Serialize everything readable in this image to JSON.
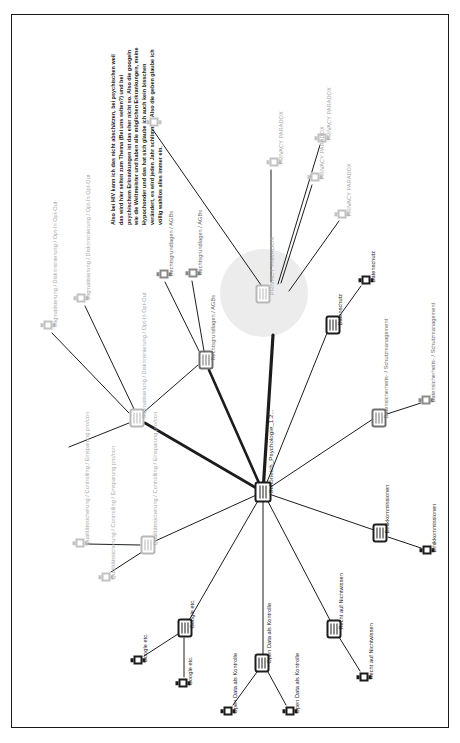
{
  "document": {
    "type": "code-map",
    "page_border_color": "#1a1a1a",
    "background": "#ffffff"
  },
  "quote": {
    "name": "memo-quote",
    "text": "Also bei HIV kann ich das nicht abschätzen, bei psychischen weil das wird hier selten zum Thema (Bei uns selten?) und bei psychischem Erkrankungen ist das eher nicht so. Also die googeln wie die Weltmeister und haben alle möglichen Erkrankungen, meine Hypochonder und das hat sich glaube ich auch kein bisschen verändert, es wird jeden Jahr schlimmer. Also die geben glaube ich völlig wahllos alles immer ein."
  },
  "central": {
    "name": "privacy-paradox-hub",
    "label": "PRIVACY PARADOX",
    "halo_color": "#ececec"
  },
  "hub": {
    "name": "document-hub",
    "label": "Schöneich_Psychologie_1.2..."
  },
  "nodes": [
    {
      "id": "pp-center",
      "label": "PRIVACY PARADOX",
      "glyph": "code",
      "tone": "light",
      "x": 261,
      "y": 279,
      "lx": 10,
      "ly": 6,
      "rot": true
    },
    {
      "id": "pp-1",
      "label": "PRIVACY PARADOX",
      "glyph": "memo",
      "tone": "light",
      "x": 310,
      "y": 123,
      "lx": 9,
      "ly": 6
    },
    {
      "id": "pp-2",
      "label": "PRIVACY PARADOX",
      "glyph": "memo",
      "tone": "light",
      "x": 262,
      "y": 147,
      "lx": 9,
      "ly": 6
    },
    {
      "id": "pp-3",
      "label": "PRIVACY PARADOX",
      "glyph": "memo",
      "tone": "light",
      "x": 303,
      "y": 162,
      "lx": 9,
      "ly": 6
    },
    {
      "id": "pp-4",
      "label": "PRIVACY PARADOX",
      "glyph": "memo",
      "tone": "light",
      "x": 330,
      "y": 199,
      "lx": 9,
      "ly": 6
    },
    {
      "id": "quote-memo",
      "label": "",
      "glyph": "memo",
      "tone": "light",
      "x": 142,
      "y": 107,
      "lx": 0,
      "ly": 0
    },
    {
      "id": "rg-node",
      "label": "Rechtsgrundlagen / AGBs",
      "glyph": "code",
      "tone": "mid",
      "x": 194,
      "y": 345,
      "lx": 10,
      "ly": 6,
      "rot": true
    },
    {
      "id": "rg-m1",
      "label": "Rechtsgrundlagen / AGBs",
      "glyph": "memo",
      "tone": "mid",
      "x": 181,
      "y": 258,
      "lx": 9,
      "ly": 6
    },
    {
      "id": "rg-m2",
      "label": "Rechtsgrundlagen / AGBs",
      "glyph": "memo",
      "tone": "mid",
      "x": 152,
      "y": 259,
      "lx": 9,
      "ly": 6
    },
    {
      "id": "st-node",
      "label": "Stigmatisierung / Diskriminierung / Opt-In Opt-Out",
      "glyph": "code",
      "tone": "light",
      "x": 125,
      "y": 403,
      "lx": 10,
      "ly": 6,
      "rot": true
    },
    {
      "id": "st-m1",
      "label": "Stigmatisierung / Diskriminierung / Opt-In Opt-Out",
      "glyph": "memo",
      "tone": "light",
      "x": 69,
      "y": 283,
      "lx": 9,
      "ly": 6
    },
    {
      "id": "st-m2",
      "label": "Stigmatisierung / Diskriminierung / Opt-In Opt-Out",
      "glyph": "memo",
      "tone": "light",
      "x": 36,
      "y": 310,
      "lx": 9,
      "ly": 6
    },
    {
      "id": "qs-node",
      "label": "Qualitätssicherung / Controlling / Einsparung pro/con",
      "glyph": "code",
      "tone": "light",
      "x": 136,
      "y": 530,
      "lx": 10,
      "ly": 6,
      "rot": true
    },
    {
      "id": "qs-m1",
      "label": "Qualitätssicherung / Controlling / Einsparung pro/con",
      "glyph": "memo",
      "tone": "light",
      "x": 68,
      "y": 528,
      "lx": 9,
      "ly": 6
    },
    {
      "id": "qs-m2",
      "label": "Qualitätssicherung / Controlling / Einsparung pro/con",
      "glyph": "memo",
      "tone": "light",
      "x": 94,
      "y": 562,
      "lx": 9,
      "ly": 6
    },
    {
      "id": "gg-node",
      "label": "Google etc.",
      "glyph": "code",
      "tone": "dark",
      "x": 173,
      "y": 613,
      "lx": 10,
      "ly": 6,
      "rot": true
    },
    {
      "id": "gg-m1",
      "label": "Google etc.",
      "glyph": "memo",
      "tone": "dark",
      "x": 126,
      "y": 645,
      "lx": 9,
      "ly": 6
    },
    {
      "id": "gg-m2",
      "label": "Google etc.",
      "glyph": "memo",
      "tone": "dark",
      "x": 171,
      "y": 668,
      "lx": 9,
      "ly": 6
    },
    {
      "id": "od-node",
      "label": "Open Data als Kontrolle",
      "glyph": "code",
      "tone": "dark",
      "x": 250,
      "y": 648,
      "lx": 10,
      "ly": 6,
      "rot": true
    },
    {
      "id": "od-m1",
      "label": "Open Data als Kontrolle",
      "glyph": "memo",
      "tone": "dark",
      "x": 216,
      "y": 696,
      "lx": 9,
      "ly": 6
    },
    {
      "id": "od-m2",
      "label": "Open Data als Kontrolle",
      "glyph": "memo",
      "tone": "dark",
      "x": 278,
      "y": 696,
      "lx": 9,
      "ly": 6
    },
    {
      "id": "rn-node",
      "label": "Recht auf Nichtwissen",
      "glyph": "code",
      "tone": "dark",
      "x": 322,
      "y": 614,
      "lx": 10,
      "ly": 6,
      "rot": true
    },
    {
      "id": "rn-m1",
      "label": "Recht auf Nichtwissen",
      "glyph": "memo",
      "tone": "dark",
      "x": 352,
      "y": 662,
      "lx": 9,
      "ly": 6
    },
    {
      "id": "ek-node",
      "label": "Ethikkommissionen",
      "glyph": "code",
      "tone": "dark",
      "x": 368,
      "y": 518,
      "lx": 10,
      "ly": 6,
      "rot": true
    },
    {
      "id": "ek-m1",
      "label": "Ethikkommissionen",
      "glyph": "memo",
      "tone": "dark",
      "x": 415,
      "y": 535,
      "lx": 9,
      "ly": 6
    },
    {
      "id": "ds-node",
      "label": "Datensicherheits- / Schutzmanagement",
      "glyph": "code",
      "tone": "mid",
      "x": 367,
      "y": 403,
      "lx": 10,
      "ly": 6,
      "rot": true
    },
    {
      "id": "ds-m1",
      "label": "Datensicherheits- / Schutzmanagement",
      "glyph": "memo",
      "tone": "mid",
      "x": 414,
      "y": 385,
      "lx": 9,
      "ly": 6
    },
    {
      "id": "dz-node",
      "label": "Datenschutz",
      "glyph": "code",
      "tone": "dark",
      "x": 321,
      "y": 310,
      "lx": 10,
      "ly": 6,
      "rot": true
    },
    {
      "id": "dz-m1",
      "label": "Datenschutz",
      "glyph": "memo",
      "tone": "dark",
      "x": 354,
      "y": 265,
      "lx": 9,
      "ly": 6
    }
  ],
  "edges": [
    {
      "from": "hub",
      "to": "pp-center",
      "weight": "thick"
    },
    {
      "from": "hub",
      "to": "rg-node",
      "weight": "thick"
    },
    {
      "from": "hub",
      "to": "st-node",
      "weight": "thick"
    },
    {
      "from": "hub",
      "to": "qs-node",
      "weight": "thin"
    },
    {
      "from": "hub",
      "to": "gg-node",
      "weight": "thin"
    },
    {
      "from": "hub",
      "to": "od-node",
      "weight": "thin"
    },
    {
      "from": "hub",
      "to": "rn-node",
      "weight": "thin"
    },
    {
      "from": "hub",
      "to": "ek-node",
      "weight": "thin"
    },
    {
      "from": "hub",
      "to": "ds-node",
      "weight": "thin"
    },
    {
      "from": "hub",
      "to": "dz-node",
      "weight": "thin"
    }
  ],
  "colors": {
    "ink": "#1c1c1c",
    "mid": "#6e6e6e",
    "light": "#b8b8b8",
    "halo": "#ececec"
  }
}
